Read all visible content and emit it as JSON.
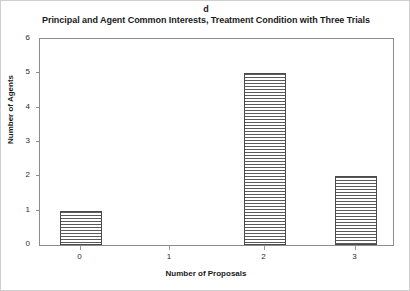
{
  "panel_label": "d",
  "title": "Principal and Agent Common Interests, Treatment Condition with Three Trials",
  "axes": {
    "x_title": "Number of Proposals",
    "y_title": "Number of Agents",
    "y_ticks": [
      "0",
      "1",
      "2",
      "3",
      "4",
      "5",
      "6"
    ],
    "x_ticks": [
      "0",
      "1",
      "2",
      "3"
    ]
  },
  "chart_data": {
    "type": "bar",
    "title": "Principal and Agent Common Interests, Treatment Condition with Three Trials",
    "panel": "d",
    "categories": [
      "0",
      "1",
      "2",
      "3"
    ],
    "values": [
      1,
      0,
      5,
      2
    ],
    "xlabel": "Number of Proposals",
    "ylabel": "Number of Agents",
    "ylim": [
      0,
      6
    ],
    "ytick_step": 1,
    "grid": false,
    "legend": false,
    "bar_style": {
      "fill": "horizontal-line-hatch",
      "edge_color": "#4a4a4a",
      "face_color": "#f2f2f2"
    }
  }
}
